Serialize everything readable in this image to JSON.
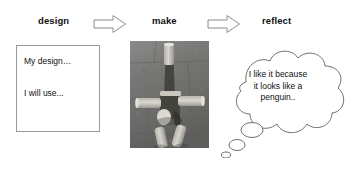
{
  "diagram": {
    "background_color": "#ffffff",
    "stroke_color": "#8c8c8c",
    "text_color": "#111111"
  },
  "stages": [
    {
      "id": "design",
      "label": "design"
    },
    {
      "id": "make",
      "label": "make"
    },
    {
      "id": "reflect",
      "label": "reflect"
    }
  ],
  "connectors": [
    {
      "id": "arrow-1",
      "icon": "right-arrow-icon",
      "from": "design",
      "to": "make"
    },
    {
      "id": "arrow-2",
      "icon": "right-arrow-icon",
      "from": "make",
      "to": "reflect"
    }
  ],
  "design_note": {
    "line1": "My design…",
    "line2": "I will use..."
  },
  "make_photo": {
    "icon": "photo-cardboard-tube-figure",
    "description": "grayscale photograph of a figure built from cardboard tubes lying on paving",
    "alt": "make"
  },
  "reflect_bubble": {
    "icon": "thought-bubble-icon",
    "lines": [
      "I like it because",
      "it looks like a",
      "penguin.."
    ]
  }
}
